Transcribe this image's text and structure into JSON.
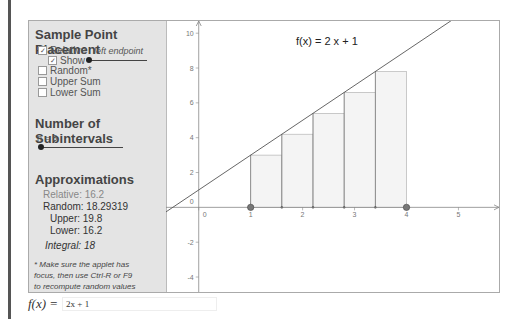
{
  "sample_point": {
    "title": "Sample Point Placement",
    "relative_label": "Relative",
    "relative_checked": true,
    "show_label": "Show",
    "show_checked": true,
    "slider_caption": "left endpoint",
    "random_label": "Random*",
    "random_checked": false,
    "upper_label": "Upper Sum",
    "upper_checked": false,
    "lower_label": "Lower Sum",
    "lower_checked": false
  },
  "subintervals": {
    "title": "Number of Subintervals",
    "n_label": "n = 5",
    "n": 5
  },
  "approximations": {
    "title": "Approximations",
    "relative": "Relative: 16.2",
    "random": "Random: 18.29319",
    "upper": "Upper: 19.8",
    "lower": "Lower: 16.2",
    "integral": "Integral:  18"
  },
  "note": {
    "line1": "* Make sure the applet has",
    "line2": "focus, then use Ctrl-R or F9",
    "line3": "to recompute random values"
  },
  "function_input": {
    "label": "f(x) =",
    "value": "2x + 1"
  },
  "chart_data": {
    "type": "bar",
    "title": "f(x) = 2 x + 1",
    "function": {
      "slope": 2,
      "intercept": 1
    },
    "interval": [
      1,
      4
    ],
    "n": 5,
    "sample": "left endpoint",
    "bars": [
      {
        "x0": 1.0,
        "x1": 1.6,
        "height": 3.0
      },
      {
        "x0": 1.6,
        "x1": 2.2,
        "height": 4.2
      },
      {
        "x0": 2.2,
        "x1": 2.8,
        "height": 5.4
      },
      {
        "x0": 2.8,
        "x1": 3.4,
        "height": 6.6
      },
      {
        "x0": 3.4,
        "x1": 4.0,
        "height": 7.8
      }
    ],
    "xlim": [
      -0.63,
      5.8
    ],
    "ylim": [
      -4.86,
      10.7
    ],
    "xticks": [
      0,
      1,
      2,
      3,
      4,
      5
    ],
    "yticks": [
      -4,
      -2,
      0,
      2,
      4,
      6,
      8,
      10
    ],
    "endpoints": [
      1,
      4
    ],
    "colors": {
      "bar_fill": "#f4f4f4",
      "bar_stroke": "#aaaaaa",
      "line": "#555555",
      "point": "#777777"
    }
  }
}
